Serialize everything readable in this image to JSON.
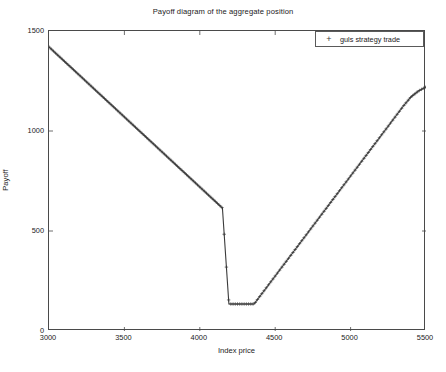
{
  "chart_data": {
    "type": "line",
    "title": "Payoff diagram of the aggregate position",
    "xlabel": "Index price",
    "ylabel": "Payoff",
    "xlim": [
      3000,
      5500
    ],
    "ylim": [
      0,
      1500
    ],
    "xticks": [
      3000,
      3500,
      4000,
      4500,
      5000,
      5500
    ],
    "yticks": [
      0,
      500,
      1000,
      1500
    ],
    "grid": false,
    "legend_position": "top-right",
    "marker": "+",
    "series": [
      {
        "name": "guls strategy trade",
        "marker": "+",
        "color": "#3a3a3a",
        "x": [
          3000,
          3050,
          3100,
          3150,
          3200,
          3250,
          3300,
          3350,
          3400,
          3450,
          3500,
          3550,
          3600,
          3650,
          3700,
          3750,
          3800,
          3850,
          3900,
          3950,
          4000,
          4050,
          4100,
          4150,
          4193,
          4250,
          4300,
          4360,
          4400,
          4450,
          4500,
          4550,
          4600,
          4650,
          4700,
          4750,
          4800,
          4850,
          4900,
          4950,
          5000,
          5050,
          5100,
          5150,
          5200,
          5250,
          5300,
          5350,
          5400,
          5450,
          5500
        ],
        "y": [
          1420,
          1385,
          1350,
          1315,
          1280,
          1245,
          1210,
          1175,
          1140,
          1105,
          1070,
          1035,
          1000,
          965,
          930,
          895,
          860,
          825,
          790,
          755,
          720,
          685,
          650,
          615,
          135,
          135,
          135,
          135,
          175,
          225,
          275,
          325,
          375,
          425,
          475,
          525,
          575,
          625,
          675,
          725,
          775,
          825,
          875,
          925,
          975,
          1025,
          1075,
          1125,
          1170,
          1200,
          1220
        ]
      }
    ],
    "annotations": {
      "kink_left_x": 4193,
      "kink_right_x": 4360,
      "min_payoff": 135,
      "left_endpoint_payoff": 1420,
      "right_endpoint_payoff": 1220
    }
  },
  "legend": {
    "marker_glyph": "+",
    "label": "guls strategy trade"
  }
}
